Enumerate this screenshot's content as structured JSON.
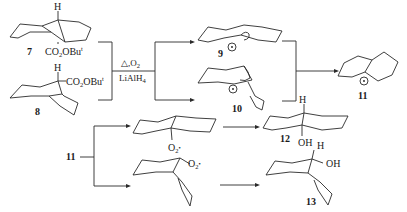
{
  "diagram": {
    "type": "reaction-scheme",
    "compounds": [
      {
        "id": "7",
        "label": "7",
        "substituent_top": "H",
        "substituent_bottom": "CO",
        "sub2": "2",
        "tail": "OBu",
        "sup": "t",
        "conformation": "trans-decalin"
      },
      {
        "id": "8",
        "label": "8",
        "substituent_top": "H",
        "substituent_side": "CO",
        "sub2": "2",
        "tail": "OBu",
        "sup": "t",
        "conformation": "cis-decalin"
      },
      {
        "id": "9",
        "label": "9",
        "radical": "•",
        "conformation": "trans-decalyl radical"
      },
      {
        "id": "10",
        "label": "10",
        "radical": "•",
        "conformation": "cis-decalyl radical"
      },
      {
        "id": "11",
        "label": "11",
        "radical": "•",
        "conformation": "planar decalyl radical"
      },
      {
        "id": "peroxy-trans",
        "label": "",
        "group": "O",
        "group_sub": "2",
        "group_dot": "•"
      },
      {
        "id": "peroxy-cis",
        "label": "",
        "group": "O",
        "group_sub": "2",
        "group_dot": "•"
      },
      {
        "id": "12",
        "label": "12",
        "substituent_top": "H",
        "substituent_bottom": "OH"
      },
      {
        "id": "13",
        "label": "13",
        "substituent_top": "H",
        "substituent_side": "OH"
      }
    ],
    "conditions": {
      "line1": "△,O",
      "line1_sub": "2",
      "line2": "LiAlH",
      "line2_sub": "4"
    },
    "branch_source": "11"
  }
}
